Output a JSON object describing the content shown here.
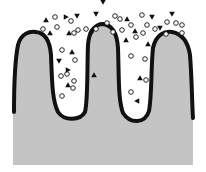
{
  "diagram": {
    "colors": {
      "background": "#ffffff",
      "tissue_fill": "#bdbdbd",
      "tissue_border": "#111111",
      "particle": "#111111"
    },
    "villi": [
      {
        "id": "left-villus",
        "left": 15,
        "right": 50,
        "top": 33
      },
      {
        "id": "middle-villus",
        "left": 87,
        "right": 119,
        "top": 24
      },
      {
        "id": "right-villus",
        "left": 150,
        "right": 192,
        "top": 32
      }
    ],
    "particles": {
      "circles": [
        [
          55,
          17
        ],
        [
          43,
          29
        ],
        [
          57,
          27
        ],
        [
          71,
          21
        ],
        [
          78,
          30
        ],
        [
          86,
          29
        ],
        [
          96,
          29
        ],
        [
          62,
          50
        ],
        [
          75,
          60
        ],
        [
          61,
          76
        ],
        [
          67,
          74
        ],
        [
          74,
          33
        ],
        [
          74,
          81
        ],
        [
          115,
          16
        ],
        [
          107,
          23
        ],
        [
          113,
          32
        ],
        [
          120,
          19
        ],
        [
          122,
          30
        ],
        [
          131,
          25
        ],
        [
          142,
          15
        ],
        [
          147,
          25
        ],
        [
          143,
          33
        ],
        [
          136,
          37
        ],
        [
          155,
          29
        ],
        [
          166,
          34
        ],
        [
          167,
          22
        ],
        [
          176,
          23
        ],
        [
          182,
          25
        ],
        [
          182,
          33
        ],
        [
          131,
          56
        ],
        [
          145,
          59
        ],
        [
          146,
          80
        ],
        [
          62,
          96
        ],
        [
          73,
          88
        ],
        [
          131,
          92
        ]
      ],
      "triangles_up": [
        [
          46,
          20
        ],
        [
          50,
          33
        ],
        [
          69,
          33
        ],
        [
          91,
          31
        ],
        [
          72,
          52
        ],
        [
          68,
          85
        ],
        [
          127,
          19
        ],
        [
          135,
          31
        ],
        [
          126,
          40
        ],
        [
          148,
          44
        ],
        [
          140,
          78
        ],
        [
          94,
          75
        ]
      ],
      "triangles_down": [
        [
          77,
          16
        ],
        [
          96,
          14
        ],
        [
          59,
          61
        ],
        [
          103,
          2
        ],
        [
          172,
          14
        ],
        [
          152,
          17
        ],
        [
          160,
          28
        ]
      ],
      "triangles_right": [
        [
          68,
          70
        ],
        [
          66,
          17
        ]
      ],
      "triangles_left": [
        [
          137,
          101
        ]
      ]
    }
  }
}
